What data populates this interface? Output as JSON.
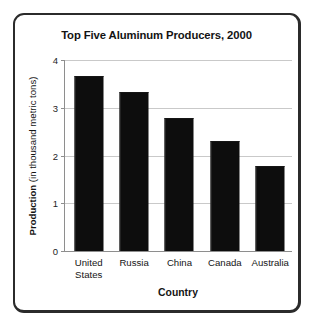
{
  "chart_data": {
    "type": "bar",
    "title": "Top Five Aluminum Producers, 2000",
    "xlabel": "Country",
    "ylabel_bold": "Production",
    "ylabel_rest": " (in thousand metric tons)",
    "ylabel": "Production (in thousand metric tons)",
    "categories": [
      "United\nStates",
      "Russia",
      "China",
      "Canada",
      "Australia"
    ],
    "category_names": [
      "United States",
      "Russia",
      "China",
      "Canada",
      "Australia"
    ],
    "values": [
      3.65,
      3.3,
      2.77,
      2.28,
      1.75
    ],
    "ylim": [
      0,
      4
    ],
    "yticks": [
      4,
      3,
      2,
      1,
      0
    ],
    "ytick_labels": [
      "4",
      "3",
      "2",
      "1",
      "0"
    ],
    "grid": true,
    "legend": "none",
    "bar_color": "#0d0d0d",
    "grid_color": "#c9c9c9",
    "axis_color": "#8e8e8e",
    "frame_color": "#2b2b2b",
    "background": "#ffffff"
  }
}
